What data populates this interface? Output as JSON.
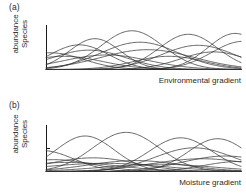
{
  "figure": {
    "panels": [
      {
        "tag": "(a)",
        "ylabel_line1": "Species",
        "ylabel_line2": "abundance",
        "xlabel": "Environmental gradient"
      },
      {
        "tag": "(b)",
        "ylabel_line1": "Species",
        "ylabel_line2": "abundance",
        "xlabel": "Moisture gradient"
      }
    ]
  },
  "chart_data": [
    {
      "type": "line",
      "title": "(a)",
      "xlabel": "Environmental gradient",
      "ylabel": "Species abundance",
      "xlim": [
        0,
        100
      ],
      "ylim": [
        0,
        100
      ],
      "grid": false,
      "axis_ticks": {
        "x": [],
        "y": []
      },
      "legend": "none",
      "annotation": "Gaussian species response curves with individualistic, overlapping optima along the gradient",
      "curve_shape": "gaussian",
      "series": [
        {
          "name": "species-1",
          "peak_x": 2,
          "peak_y": 38,
          "width": 17
        },
        {
          "name": "species-2",
          "peak_x": 9,
          "peak_y": 30,
          "width": 20
        },
        {
          "name": "species-3",
          "peak_x": 17,
          "peak_y": 56,
          "width": 15
        },
        {
          "name": "species-4",
          "peak_x": 22,
          "peak_y": 44,
          "width": 19
        },
        {
          "name": "species-5",
          "peak_x": 25,
          "peak_y": 70,
          "width": 13
        },
        {
          "name": "species-6",
          "peak_x": 31,
          "peak_y": 33,
          "width": 22
        },
        {
          "name": "species-7",
          "peak_x": 44,
          "peak_y": 88,
          "width": 16
        },
        {
          "name": "species-8",
          "peak_x": 48,
          "peak_y": 62,
          "width": 20
        },
        {
          "name": "species-9",
          "peak_x": 52,
          "peak_y": 45,
          "width": 24
        },
        {
          "name": "species-10",
          "peak_x": 63,
          "peak_y": 30,
          "width": 18
        },
        {
          "name": "species-11",
          "peak_x": 73,
          "peak_y": 80,
          "width": 15
        },
        {
          "name": "species-12",
          "peak_x": 78,
          "peak_y": 55,
          "width": 19
        },
        {
          "name": "species-13",
          "peak_x": 86,
          "peak_y": 40,
          "width": 17
        },
        {
          "name": "species-14",
          "peak_x": 97,
          "peak_y": 82,
          "width": 14
        },
        {
          "name": "species-15",
          "peak_x": 101,
          "peak_y": 64,
          "width": 16
        }
      ]
    },
    {
      "type": "line",
      "title": "(b)",
      "xlabel": "Moisture gradient",
      "ylabel": "Species abundance",
      "xlim": [
        0,
        100
      ],
      "ylim": [
        0,
        100
      ],
      "grid": false,
      "axis_ticks": {
        "x": [],
        "y": [
          50
        ]
      },
      "legend": "none",
      "annotation": "Species response curves of varying height and breadth along the moisture gradient",
      "curve_shape": "gaussian",
      "series": [
        {
          "name": "species-1",
          "peak_x": -2,
          "peak_y": 46,
          "width": 16
        },
        {
          "name": "species-2",
          "peak_x": 4,
          "peak_y": 26,
          "width": 20
        },
        {
          "name": "species-3",
          "peak_x": 11,
          "peak_y": 20,
          "width": 26
        },
        {
          "name": "species-4",
          "peak_x": 20,
          "peak_y": 78,
          "width": 15
        },
        {
          "name": "species-5",
          "peak_x": 24,
          "peak_y": 30,
          "width": 22
        },
        {
          "name": "species-6",
          "peak_x": 30,
          "peak_y": 18,
          "width": 30
        },
        {
          "name": "species-7",
          "peak_x": 41,
          "peak_y": 86,
          "width": 17
        },
        {
          "name": "species-8",
          "peak_x": 46,
          "peak_y": 24,
          "width": 24
        },
        {
          "name": "species-9",
          "peak_x": 58,
          "peak_y": 16,
          "width": 28
        },
        {
          "name": "species-10",
          "peak_x": 69,
          "peak_y": 74,
          "width": 16
        },
        {
          "name": "species-11",
          "peak_x": 76,
          "peak_y": 52,
          "width": 20
        },
        {
          "name": "species-12",
          "peak_x": 80,
          "peak_y": 28,
          "width": 26
        },
        {
          "name": "species-13",
          "peak_x": 88,
          "peak_y": 72,
          "width": 15
        },
        {
          "name": "species-14",
          "peak_x": 92,
          "peak_y": 34,
          "width": 22
        },
        {
          "name": "species-15",
          "peak_x": 99,
          "peak_y": 22,
          "width": 18
        }
      ]
    }
  ],
  "style": {
    "curve_color": "#333333",
    "axis_color": "#1a1a1a",
    "background": "#ffffff"
  }
}
